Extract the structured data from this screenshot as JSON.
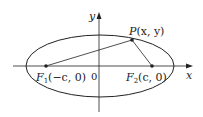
{
  "diagram": {
    "type": "ellipse-foci",
    "axes": {
      "x_label": "x",
      "y_label": "y",
      "origin_label": "0"
    },
    "ellipse": {
      "cx": 100,
      "cy": 66,
      "rx": 74,
      "ry": 31
    },
    "points": [
      {
        "id": "F1",
        "name": "F",
        "subscript": "1",
        "coords": "(−c, 0)",
        "x": 46,
        "y": 66
      },
      {
        "id": "F2",
        "name": "F",
        "subscript": "2",
        "coords": "(c, 0)",
        "x": 152,
        "y": 66
      },
      {
        "id": "P",
        "name": "P",
        "coords": "(x, y)",
        "x": 132,
        "y": 40
      }
    ],
    "colors": {
      "stroke": "#222222",
      "background": "#ffffff"
    }
  }
}
